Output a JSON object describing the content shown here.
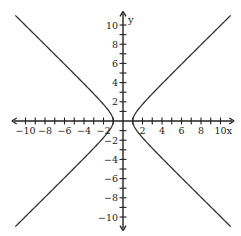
{
  "chart_data": {
    "type": "line",
    "title": "",
    "xlabel": "x",
    "ylabel": "y",
    "xlim": [
      -11,
      11
    ],
    "ylim": [
      -11,
      11
    ],
    "grid": false,
    "legend": null,
    "x_ticks": [
      -10,
      -8,
      -6,
      -4,
      -2,
      2,
      4,
      6,
      8,
      10
    ],
    "y_ticks": [
      -10,
      -8,
      -6,
      -4,
      -2,
      2,
      4,
      6,
      8,
      10
    ],
    "x_tick_labels": [
      "-10",
      "-8",
      "-6",
      "-4",
      "-2",
      "2",
      "4",
      "6",
      "8",
      "10"
    ],
    "y_tick_labels": [
      "-10",
      "-8",
      "-6",
      "-4",
      "-2",
      "2",
      "4",
      "6",
      "8",
      "10"
    ],
    "minor_tick_step": 1,
    "series": [
      {
        "name": "hyperbola",
        "equation": "x^2 - y^2 = 1",
        "a": 1,
        "b": 1,
        "orientation": "horizontal",
        "vertices": [
          [
            -1,
            0
          ],
          [
            1,
            0
          ]
        ],
        "branches": [
          "left",
          "right"
        ],
        "y_range": [
          -11,
          11
        ],
        "color": "#333333"
      }
    ]
  },
  "axes": {
    "x_name": "x",
    "y_name": "y",
    "color": "#222222"
  },
  "layout": {
    "origin_px": [
      123,
      121
    ],
    "px_per_unit_x": 9.75,
    "px_per_unit_y": 9.6
  }
}
